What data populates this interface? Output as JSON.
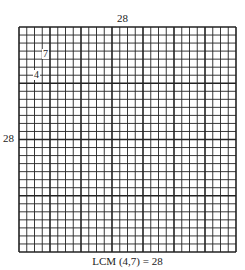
{
  "diagram": {
    "top_label": "28",
    "left_label": "28",
    "caption": "LCM (4,7) = 28",
    "inner_labels": {
      "seven": "7",
      "four": "4"
    },
    "grid": {
      "columns": 28,
      "rows": 28,
      "thick_every_columns": 4,
      "thick_every_rows": 7,
      "line_color": "#222222",
      "background": "#ffffff"
    }
  }
}
